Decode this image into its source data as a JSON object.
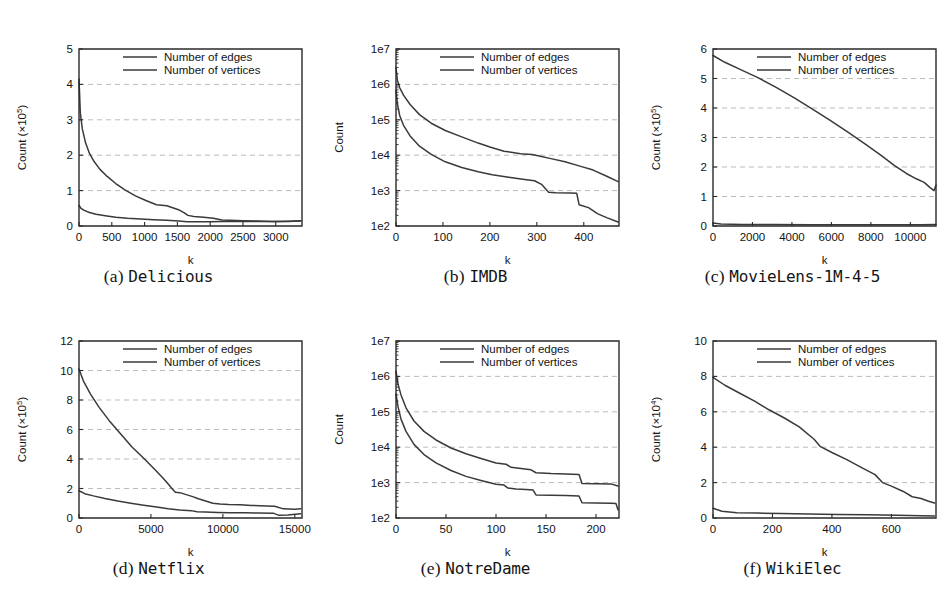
{
  "figure": {
    "legend_labels": [
      "Number of edges",
      "Number of vertices"
    ],
    "xlabel": "k",
    "series_color": "#3a3a3a"
  },
  "panels": [
    {
      "id": "a",
      "index_label": "(a)",
      "name": "Delicious",
      "caption": "(a) Delicious",
      "ylabel_main": "Count (×10",
      "ylabel_exp": "5",
      "ylabel": "Count (×10⁵)",
      "xlabel": "k",
      "scale": "linear",
      "xticks": [
        0,
        500,
        1000,
        1500,
        2000,
        2500,
        3000
      ],
      "xticklabels": [
        "0",
        "500",
        "1000",
        "1500",
        "2000",
        "2500",
        "3000"
      ],
      "yticks": [
        0,
        1,
        2,
        3,
        4,
        5
      ],
      "yticklabels": [
        "0",
        "1",
        "2",
        "3",
        "4",
        "5"
      ],
      "xlim": [
        0,
        3400
      ],
      "ylim": [
        0,
        5
      ],
      "legend": [
        "Number of edges",
        "Number of vertices"
      ]
    },
    {
      "id": "b",
      "index_label": "(b)",
      "name": "IMDB",
      "caption": "(b) IMDB",
      "ylabel": "Count",
      "xlabel": "k",
      "scale": "log",
      "xticks": [
        0,
        100,
        200,
        300,
        400
      ],
      "xticklabels": [
        "0",
        "100",
        "200",
        "300",
        "400"
      ],
      "yticks": [
        100,
        1000,
        10000,
        100000,
        1000000,
        10000000
      ],
      "yticklabels": [
        "1e2",
        "1e3",
        "1e4",
        "1e5",
        "1e6",
        "1e7"
      ],
      "xlim": [
        0,
        475
      ],
      "ylim": [
        100,
        10000000
      ],
      "legend": [
        "Number of edges",
        "Number of vertices"
      ]
    },
    {
      "id": "c",
      "index_label": "(c)",
      "name": "MovieLens-1M-4-5",
      "caption": "(c) MovieLens-1M-4-5",
      "ylabel_main": "Count (×10",
      "ylabel_exp": "5",
      "ylabel": "Count (×10⁵)",
      "xlabel": "k",
      "scale": "linear",
      "xticks": [
        0,
        2000,
        4000,
        6000,
        8000,
        10000
      ],
      "xticklabels": [
        "0",
        "2000",
        "4000",
        "6000",
        "8000",
        "10000"
      ],
      "yticks": [
        0,
        1,
        2,
        3,
        4,
        5,
        6
      ],
      "yticklabels": [
        "0",
        "1",
        "2",
        "3",
        "4",
        "5",
        "6"
      ],
      "xlim": [
        0,
        11300
      ],
      "ylim": [
        0,
        6
      ],
      "legend": [
        "Number of edges",
        "Number of vertices"
      ]
    },
    {
      "id": "d",
      "index_label": "(d)",
      "name": "Netflix",
      "caption": "(d) Netflix",
      "ylabel_main": "Count (×10",
      "ylabel_exp": "5",
      "ylabel": "Count (×10⁵)",
      "xlabel": "k",
      "scale": "linear",
      "xticks": [
        0,
        5000,
        10000,
        15000
      ],
      "xticklabels": [
        "0",
        "5000",
        "10000",
        "15000"
      ],
      "yticks": [
        0,
        2,
        4,
        6,
        8,
        10,
        12
      ],
      "yticklabels": [
        "0",
        "2",
        "4",
        "6",
        "8",
        "10",
        "12"
      ],
      "xlim": [
        0,
        15500
      ],
      "ylim": [
        0,
        12
      ],
      "legend": [
        "Number of edges",
        "Number of vertices"
      ]
    },
    {
      "id": "e",
      "index_label": "(e)",
      "name": "NotreDame",
      "caption": "(e) NotreDame",
      "ylabel": "Count",
      "xlabel": "k",
      "scale": "log",
      "xticks": [
        0,
        50,
        100,
        150,
        200
      ],
      "xticklabels": [
        "0",
        "50",
        "100",
        "150",
        "200"
      ],
      "yticks": [
        100,
        1000,
        10000,
        100000,
        1000000,
        10000000
      ],
      "yticklabels": [
        "1e2",
        "1e3",
        "1e4",
        "1e5",
        "1e6",
        "1e7"
      ],
      "xlim": [
        0,
        223
      ],
      "ylim": [
        100,
        10000000
      ],
      "legend": [
        "Number of edges",
        "Number of vertices"
      ]
    },
    {
      "id": "f",
      "index_label": "(f)",
      "name": "WikiElec",
      "caption": "(f) WikiElec",
      "ylabel_main": "Count (×10",
      "ylabel_exp": "4",
      "ylabel": "Count (×10⁴)",
      "xlabel": "k",
      "scale": "linear",
      "xticks": [
        0,
        200,
        400,
        600
      ],
      "xticklabels": [
        "0",
        "200",
        "400",
        "600"
      ],
      "yticks": [
        0,
        2,
        4,
        6,
        8,
        10
      ],
      "yticklabels": [
        "0",
        "2",
        "4",
        "6",
        "8",
        "10"
      ],
      "xlim": [
        0,
        750
      ],
      "ylim": [
        0,
        10
      ],
      "legend": [
        "Number of edges",
        "Number of vertices"
      ]
    }
  ],
  "chart_data": [
    {
      "type": "line",
      "panel": "a",
      "title": "(a) Delicious",
      "xlabel": "k",
      "ylabel": "Count (×10⁵)",
      "xlim": [
        0,
        3400
      ],
      "ylim": [
        0,
        5
      ],
      "grid": true,
      "legend_position": "top-center",
      "series": [
        {
          "name": "Number of edges",
          "x": [
            0,
            20,
            50,
            100,
            160,
            230,
            320,
            430,
            560,
            700,
            860,
            1020,
            1180,
            1340,
            1450,
            1530,
            1600,
            1660,
            1750,
            1900,
            2050,
            2180,
            2300,
            2500,
            2700,
            2950,
            3200,
            3380
          ],
          "y": [
            4.15,
            3.2,
            2.75,
            2.35,
            2.05,
            1.82,
            1.6,
            1.4,
            1.2,
            1.02,
            0.85,
            0.72,
            0.6,
            0.57,
            0.5,
            0.45,
            0.38,
            0.3,
            0.27,
            0.25,
            0.22,
            0.17,
            0.16,
            0.15,
            0.14,
            0.13,
            0.13,
            0.15
          ]
        },
        {
          "name": "Number of vertices",
          "x": [
            0,
            30,
            80,
            160,
            260,
            400,
            560,
            740,
            940,
            1140,
            1340,
            1520,
            1650,
            1800,
            2000,
            2180,
            2400,
            2700,
            3000,
            3380
          ],
          "y": [
            0.58,
            0.5,
            0.44,
            0.38,
            0.33,
            0.29,
            0.25,
            0.22,
            0.2,
            0.18,
            0.16,
            0.14,
            0.12,
            0.12,
            0.12,
            0.13,
            0.13,
            0.13,
            0.13,
            0.14
          ]
        }
      ]
    },
    {
      "type": "line",
      "panel": "b",
      "title": "(b) IMDB",
      "xlabel": "k",
      "ylabel": "Count",
      "yscale": "log",
      "xlim": [
        0,
        475
      ],
      "ylim": [
        100,
        10000000
      ],
      "grid": true,
      "legend_position": "top-center",
      "series": [
        {
          "name": "Number of edges",
          "x": [
            0,
            3,
            8,
            16,
            30,
            50,
            75,
            105,
            140,
            175,
            200,
            230,
            265,
            290,
            305,
            330,
            360,
            390,
            420,
            450,
            473
          ],
          "y": [
            3000000,
            1300000,
            800000,
            500000,
            270000,
            140000,
            80000,
            50000,
            33000,
            22000,
            17000,
            13000,
            11000,
            10500,
            9500,
            8000,
            6500,
            5000,
            3800,
            2500,
            1800
          ]
        },
        {
          "name": "Number of vertices",
          "x": [
            0,
            3,
            8,
            16,
            30,
            50,
            75,
            105,
            140,
            175,
            205,
            240,
            270,
            295,
            310,
            325,
            340,
            370,
            385,
            390,
            410,
            430,
            450,
            473
          ],
          "y": [
            700000,
            280000,
            130000,
            70000,
            35000,
            18000,
            10500,
            6500,
            4500,
            3400,
            2800,
            2400,
            2100,
            1900,
            1500,
            900,
            870,
            850,
            840,
            400,
            330,
            220,
            170,
            130
          ]
        }
      ]
    },
    {
      "type": "line",
      "panel": "c",
      "title": "(c) MovieLens-1M-4-5",
      "xlabel": "k",
      "ylabel": "Count (×10⁵)",
      "xlim": [
        0,
        11300
      ],
      "ylim": [
        0,
        6
      ],
      "grid": true,
      "legend_position": "top-center",
      "series": [
        {
          "name": "Number of edges",
          "x": [
            0,
            600,
            1400,
            2300,
            3200,
            4100,
            5000,
            5900,
            6800,
            7700,
            8500,
            9200,
            9800,
            10300,
            10700,
            11000,
            11200,
            11300
          ],
          "y": [
            5.78,
            5.55,
            5.3,
            5.02,
            4.7,
            4.35,
            3.98,
            3.6,
            3.2,
            2.78,
            2.4,
            2.05,
            1.78,
            1.6,
            1.48,
            1.3,
            1.2,
            1.38
          ]
        },
        {
          "name": "Number of vertices",
          "x": [
            0,
            400,
            1500,
            3000,
            5000,
            7000,
            9000,
            10500,
            11300
          ],
          "y": [
            0.1,
            0.07,
            0.055,
            0.05,
            0.045,
            0.04,
            0.04,
            0.04,
            0.05
          ]
        }
      ]
    },
    {
      "type": "line",
      "panel": "d",
      "title": "(d) Netflix",
      "xlabel": "k",
      "ylabel": "Count (×10⁵)",
      "xlim": [
        0,
        15500
      ],
      "ylim": [
        0,
        12
      ],
      "grid": true,
      "legend_position": "top-center",
      "series": [
        {
          "name": "Number of edges",
          "x": [
            0,
            300,
            800,
            1400,
            2100,
            2900,
            3700,
            4500,
            5200,
            5800,
            6200,
            6500,
            6700,
            7000,
            7400,
            7900,
            8300,
            8800,
            9300,
            9800,
            10400,
            11200,
            12000,
            13000,
            13600,
            14200,
            15000,
            15400
          ],
          "y": [
            10.1,
            9.3,
            8.4,
            7.5,
            6.6,
            5.7,
            4.8,
            4.05,
            3.35,
            2.75,
            2.3,
            1.95,
            1.75,
            1.72,
            1.6,
            1.45,
            1.3,
            1.15,
            1.0,
            0.95,
            0.92,
            0.9,
            0.85,
            0.82,
            0.8,
            0.62,
            0.6,
            0.62
          ]
        },
        {
          "name": "Number of vertices",
          "x": [
            0,
            400,
            1000,
            1800,
            2700,
            3600,
            4500,
            5400,
            6200,
            7000,
            7800,
            8200,
            8800,
            9600,
            10500,
            11500,
            12500,
            13500,
            13900,
            14500,
            15400
          ],
          "y": [
            1.85,
            1.65,
            1.5,
            1.32,
            1.15,
            1.0,
            0.87,
            0.75,
            0.62,
            0.55,
            0.5,
            0.42,
            0.4,
            0.38,
            0.36,
            0.35,
            0.34,
            0.33,
            0.18,
            0.2,
            0.28
          ]
        }
      ]
    },
    {
      "type": "line",
      "panel": "e",
      "title": "(e) NotreDame",
      "xlabel": "k",
      "ylabel": "Count",
      "yscale": "log",
      "xlim": [
        0,
        223
      ],
      "ylim": [
        100,
        10000000
      ],
      "grid": true,
      "legend_position": "top-center",
      "series": [
        {
          "name": "Number of edges",
          "x": [
            0,
            2,
            5,
            10,
            18,
            28,
            40,
            55,
            70,
            85,
            100,
            110,
            115,
            125,
            135,
            140,
            155,
            170,
            183,
            186,
            200,
            215,
            222
          ],
          "y": [
            1400000,
            600000,
            300000,
            130000,
            55000,
            28000,
            16000,
            9500,
            6500,
            4800,
            3600,
            3300,
            2700,
            2500,
            2300,
            1900,
            1800,
            1750,
            1700,
            950,
            930,
            920,
            800
          ]
        },
        {
          "name": "Number of vertices",
          "x": [
            0,
            2,
            5,
            10,
            18,
            28,
            40,
            55,
            70,
            85,
            100,
            108,
            112,
            120,
            130,
            137,
            140,
            155,
            170,
            183,
            186,
            200,
            215,
            220,
            222
          ],
          "y": [
            320000,
            140000,
            62000,
            28000,
            12000,
            6200,
            3600,
            2200,
            1500,
            1150,
            900,
            850,
            700,
            660,
            640,
            620,
            450,
            440,
            430,
            420,
            270,
            265,
            260,
            255,
            170
          ]
        }
      ]
    },
    {
      "type": "line",
      "panel": "f",
      "title": "(f) WikiElec",
      "xlabel": "k",
      "ylabel": "Count (×10⁴)",
      "xlim": [
        0,
        750
      ],
      "ylim": [
        0,
        10
      ],
      "grid": true,
      "legend_position": "top-center",
      "series": [
        {
          "name": "Number of edges",
          "x": [
            0,
            40,
            90,
            140,
            190,
            240,
            290,
            340,
            360,
            400,
            450,
            500,
            545,
            570,
            600,
            640,
            670,
            700,
            725,
            745
          ],
          "y": [
            7.95,
            7.5,
            7.05,
            6.6,
            6.1,
            5.65,
            5.15,
            4.45,
            4.05,
            3.7,
            3.3,
            2.85,
            2.45,
            2.0,
            1.8,
            1.5,
            1.2,
            1.1,
            0.95,
            0.85
          ]
        },
        {
          "name": "Number of vertices",
          "x": [
            0,
            30,
            80,
            150,
            230,
            320,
            420,
            520,
            620,
            700,
            745
          ],
          "y": [
            0.55,
            0.38,
            0.3,
            0.28,
            0.25,
            0.22,
            0.2,
            0.18,
            0.15,
            0.13,
            0.12
          ]
        }
      ]
    }
  ]
}
